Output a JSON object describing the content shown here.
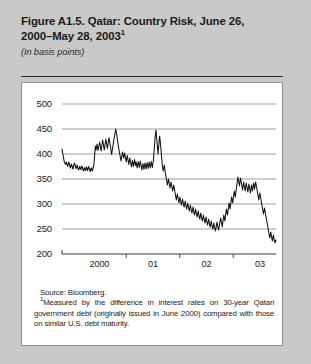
{
  "figure": {
    "title_line1": "Figure A1.5. Qatar: Country Risk, June 26,",
    "title_line2": "2000–May 28, 2003",
    "title_superscript": "1",
    "subtitle": "(In basis points)",
    "source": "Source: Bloomberg.",
    "footnote_marker": "1",
    "footnote_text": "Measured by the difference in interest rates on 30-year Qatari government debt (originally issued in June 2000) compared with those on similar U.S. debt maturity."
  },
  "chart_data": {
    "type": "line",
    "title": "Figure A1.5. Qatar: Country Risk, June 26, 2000–May 28, 2003",
    "xlabel": "",
    "ylabel": "In basis points",
    "ylim": [
      200,
      500
    ],
    "yticks": [
      200,
      250,
      300,
      350,
      400,
      450,
      500
    ],
    "ytick_labels": [
      "200",
      "250",
      "300",
      "350",
      "400",
      "450",
      "500"
    ],
    "xtick_labels": [
      "2000",
      "01",
      "02",
      "03"
    ],
    "xtick_positions": [
      0.175,
      0.425,
      0.675,
      0.925
    ],
    "grid": true,
    "legend": false,
    "line_color": "#111111",
    "series": [
      {
        "name": "Qatar country risk spread",
        "values": [
          410,
          404,
          398,
          392,
          386,
          383,
          381,
          379,
          384,
          381,
          378,
          375,
          380,
          384,
          380,
          376,
          372,
          376,
          380,
          377,
          373,
          370,
          374,
          379,
          382,
          378,
          374,
          371,
          374,
          378,
          374,
          370,
          368,
          372,
          375,
          372,
          369,
          372,
          376,
          373,
          369,
          366,
          369,
          373,
          370,
          367,
          371,
          374,
          370,
          367,
          371,
          375,
          372,
          368,
          365,
          369,
          372,
          369,
          366,
          370,
          374,
          378,
          390,
          404,
          416,
          408,
          412,
          420,
          414,
          407,
          412,
          418,
          424,
          418,
          412,
          406,
          414,
          422,
          428,
          421,
          414,
          408,
          415,
          423,
          430,
          424,
          417,
          411,
          418,
          426,
          433,
          427,
          420,
          414,
          406,
          399,
          405,
          412,
          419,
          426,
          432,
          438,
          444,
          450,
          444,
          437,
          430,
          423,
          416,
          410,
          404,
          398,
          392,
          386,
          392,
          398,
          404,
          398,
          392,
          396,
          402,
          396,
          390,
          384,
          391,
          397,
          391,
          385,
          379,
          386,
          392,
          386,
          380,
          374,
          380,
          387,
          381,
          375,
          382,
          389,
          383,
          377,
          384,
          378,
          372,
          379,
          385,
          379,
          373,
          380,
          386,
          380,
          374,
          368,
          375,
          381,
          375,
          369,
          376,
          382,
          376,
          370,
          377,
          383,
          377,
          371,
          378,
          384,
          378,
          372,
          379,
          385,
          379,
          373,
          380,
          386,
          400,
          414,
          428,
          440,
          448,
          436,
          424,
          412,
          400,
          412,
          424,
          436,
          428,
          416,
          404,
          392,
          380,
          372,
          366,
          372,
          378,
          370,
          362,
          356,
          350,
          344,
          338,
          344,
          350,
          344,
          338,
          332,
          338,
          344,
          338,
          332,
          326,
          332,
          338,
          332,
          326,
          320,
          314,
          308,
          314,
          320,
          314,
          308,
          302,
          308,
          314,
          308,
          302,
          298,
          304,
          310,
          304,
          298,
          294,
          300,
          306,
          300,
          294,
          290,
          296,
          302,
          296,
          290,
          286,
          292,
          298,
          292,
          286,
          282,
          288,
          294,
          288,
          282,
          278,
          284,
          290,
          284,
          278,
          274,
          280,
          286,
          280,
          274,
          270,
          276,
          282,
          276,
          270,
          266,
          272,
          278,
          272,
          266,
          262,
          268,
          274,
          268,
          262,
          258,
          264,
          270,
          264,
          258,
          254,
          260,
          266,
          260,
          254,
          250,
          256,
          262,
          256,
          250,
          246,
          252,
          258,
          264,
          258,
          252,
          248,
          254,
          260,
          266,
          272,
          266,
          260,
          254,
          262,
          270,
          278,
          272,
          266,
          274,
          282,
          290,
          284,
          278,
          286,
          294,
          302,
          296,
          290,
          298,
          306,
          314,
          308,
          302,
          310,
          318,
          326,
          320,
          314,
          322,
          330,
          338,
          346,
          354,
          348,
          342,
          336,
          344,
          352,
          346,
          340,
          334,
          328,
          336,
          344,
          338,
          332,
          326,
          334,
          342,
          336,
          330,
          324,
          332,
          340,
          334,
          328,
          322,
          330,
          338,
          332,
          326,
          334,
          342,
          336,
          330,
          338,
          344,
          338,
          332,
          326,
          320,
          314,
          308,
          316,
          322,
          316,
          310,
          304,
          298,
          292,
          286,
          280,
          286,
          292,
          286,
          280,
          274,
          268,
          262,
          256,
          250,
          244,
          238,
          232,
          238,
          244,
          238,
          232,
          226,
          232,
          238,
          232,
          226,
          222,
          228,
          226
        ]
      }
    ]
  }
}
